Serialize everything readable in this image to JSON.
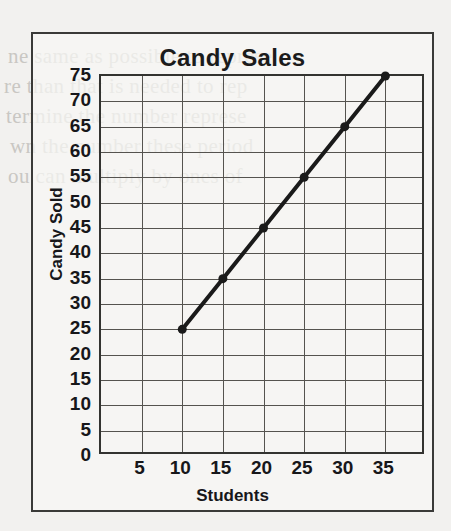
{
  "page": {
    "background_color": "#f2f1ef",
    "border_color": "#3a3a38"
  },
  "background_text": [
    "ne same as possible to represe",
    "re than that is needed to rep",
    "termine the number represe",
    "wn the number these period",
    "ou can multiply by ones of"
  ],
  "chart_data": {
    "type": "line",
    "title": "Candy Sales",
    "xlabel": "Students",
    "ylabel": "Candy Sold",
    "x": [
      10,
      15,
      20,
      25,
      30,
      35
    ],
    "values": [
      25,
      35,
      45,
      55,
      65,
      75
    ],
    "series": [
      {
        "name": "Candy Sales",
        "x": [
          10,
          15,
          20,
          25,
          30,
          35
        ],
        "values": [
          25,
          35,
          45,
          55,
          65,
          75
        ]
      }
    ],
    "points": [
      {
        "x": 10,
        "y": 25
      },
      {
        "x": 15,
        "y": 35
      },
      {
        "x": 20,
        "y": 45
      },
      {
        "x": 25,
        "y": 55
      },
      {
        "x": 30,
        "y": 65
      },
      {
        "x": 35,
        "y": 75
      }
    ],
    "xlim": [
      0,
      40
    ],
    "ylim": [
      0,
      75
    ],
    "xticks": [
      5,
      10,
      15,
      20,
      25,
      30,
      35
    ],
    "yticks": [
      0,
      5,
      10,
      15,
      20,
      25,
      30,
      35,
      40,
      45,
      50,
      55,
      60,
      65,
      70,
      75
    ],
    "xtick_labels": [
      "5",
      "10",
      "15",
      "20",
      "25",
      "30",
      "35"
    ],
    "ytick_labels": [
      "0",
      "5",
      "10",
      "15",
      "20",
      "25",
      "30",
      "35",
      "40",
      "45",
      "50",
      "55",
      "60",
      "65",
      "70",
      "75"
    ],
    "x_step": 5,
    "y_step": 5,
    "grid": true,
    "grid_color": "#55534f",
    "legend": false,
    "legend_position": "none",
    "line_color": "#1a1a1a",
    "line_width": 4,
    "marker": "circle",
    "marker_color": "#1a1a1a",
    "marker_size": 9
  }
}
